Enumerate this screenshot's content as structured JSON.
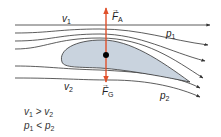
{
  "diagram": {
    "colors": {
      "streamline": "#333333",
      "airfoil_fill": "#c9d3de",
      "airfoil_stroke": "#333333",
      "force_axis": "#e0502a",
      "center_point": "#000000"
    },
    "labels": {
      "v1": {
        "symbol": "v",
        "sub": "1"
      },
      "v2": {
        "symbol": "v",
        "sub": "2"
      },
      "p1": {
        "symbol": "p",
        "sub": "1"
      },
      "p2": {
        "symbol": "p",
        "sub": "2"
      },
      "FA": {
        "symbol": "F",
        "sub": "A",
        "arrow": "→"
      },
      "FG": {
        "symbol": "F",
        "sub": "G",
        "arrow": "→"
      }
    },
    "relations": [
      {
        "left": "v",
        "left_sub": "1",
        "op": ">",
        "right": "v",
        "right_sub": "2"
      },
      {
        "left": "p",
        "left_sub": "1",
        "op": "<",
        "right": "p",
        "right_sub": "2"
      }
    ]
  }
}
